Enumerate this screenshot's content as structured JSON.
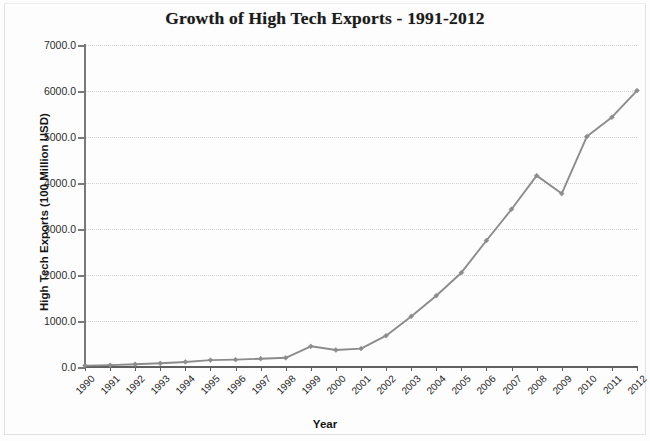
{
  "chart_data": {
    "type": "line",
    "title": "Growth of High Tech Exports - 1991-2012",
    "xlabel": "Year",
    "ylabel": "High Tech Exports (100 Million USD)",
    "xlim": [
      1990,
      2012
    ],
    "ylim": [
      0,
      7000
    ],
    "grid": true,
    "legend": "none",
    "categories": [
      "1990",
      "1991",
      "1992",
      "1993",
      "1994",
      "1995",
      "1996",
      "1997",
      "1998",
      "1999",
      "2000",
      "2001",
      "2002",
      "2003",
      "2004",
      "2005",
      "2006",
      "2007",
      "2008",
      "2009",
      "2010",
      "2011",
      "2012"
    ],
    "x": [
      1990,
      1991,
      1992,
      1993,
      1994,
      1995,
      1996,
      1997,
      1998,
      1999,
      2000,
      2001,
      2002,
      2003,
      2004,
      2005,
      2006,
      2007,
      2008,
      2009,
      2010,
      2011,
      2012
    ],
    "values": [
      30,
      40,
      60,
      80,
      110,
      150,
      160,
      180,
      200,
      450,
      370,
      400,
      680,
      1100,
      1550,
      2050,
      2750,
      3430,
      4160,
      3770,
      5010,
      5430,
      6010
    ],
    "ytick_labels": [
      "7000.0",
      "6000.0",
      "5000.0",
      "4000.0",
      "3000.0",
      "2000.0",
      "1000.0",
      "0.0"
    ],
    "ytick_values": [
      7000,
      6000,
      5000,
      4000,
      3000,
      2000,
      1000,
      0
    ],
    "series": [
      {
        "name": "High Tech Exports",
        "color": "#8c8c8c",
        "marker": "diamond",
        "values": [
          30,
          40,
          60,
          80,
          110,
          150,
          160,
          180,
          200,
          450,
          370,
          400,
          680,
          1100,
          1550,
          2050,
          2750,
          3430,
          4160,
          3770,
          5010,
          5430,
          6010
        ]
      }
    ]
  }
}
